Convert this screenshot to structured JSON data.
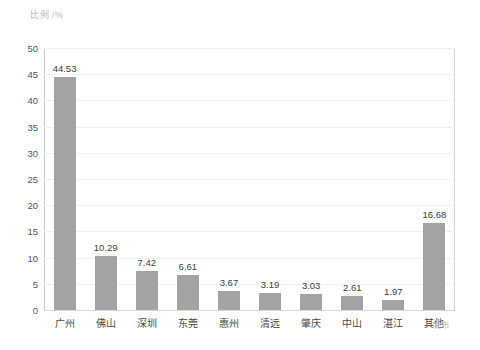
{
  "chart_data": {
    "type": "bar",
    "title": "",
    "subtitle": "",
    "xlabel": "城市",
    "ylabel": "比例 /%",
    "categories": [
      "广州",
      "佛山",
      "深圳",
      "东莞",
      "惠州",
      "清远",
      "肇庆",
      "中山",
      "湛江",
      "其他"
    ],
    "values": [
      44.53,
      10.29,
      7.42,
      6.61,
      3.67,
      3.19,
      3.03,
      2.61,
      1.97,
      16.68
    ],
    "value_labels": [
      "44.53",
      "10.29",
      "7.42",
      "6.61",
      "3.67",
      "3.19",
      "3.03",
      "2.61",
      "1.97",
      "16.68"
    ],
    "ylim": [
      0,
      50
    ],
    "ytick_step": 5,
    "ytick_labels": [
      "0",
      "5",
      "10",
      "15",
      "20",
      "25",
      "30",
      "35",
      "40",
      "45",
      "50"
    ],
    "grid": true,
    "grid_axis": "y",
    "legend": false,
    "legend_position": "none",
    "bar_color": "#a3a3a3",
    "grid_color": "#f0f0f0",
    "axis_color": "#c9c9c9",
    "background_color": "#ffffff",
    "tick_label_color": "#555555",
    "value_label_color": "#404040",
    "axis_title_color": "#c0c0c0"
  }
}
